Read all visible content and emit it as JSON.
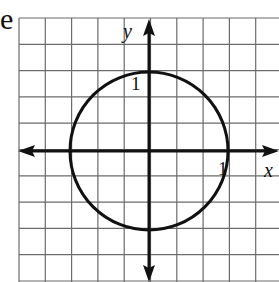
{
  "figure": {
    "fragment_text": "e",
    "axis_labels": {
      "x": "x",
      "y": "y"
    },
    "tick_labels": {
      "x_one": "1",
      "y_one": "1"
    },
    "grid": {
      "x0": 19,
      "y0": 18,
      "cell": 26.3,
      "cols": 10,
      "rows": 10
    },
    "axes": {
      "origin_x": 149,
      "origin_y": 151
    },
    "circle": {
      "cx": 149,
      "cy": 151,
      "r": 79,
      "equation": "x^2 + y^2 = 1"
    },
    "colors": {
      "grid": "#6b6b6b",
      "ink": "#111111",
      "background": "#ffffff"
    }
  }
}
